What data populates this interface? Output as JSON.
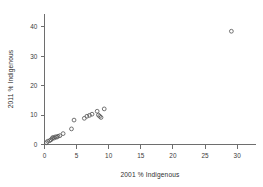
{
  "chart_data": {
    "type": "scatter",
    "title": "",
    "xlabel": "2001 % Indigenous",
    "ylabel": "2011 % Indigenous",
    "xlim": [
      0,
      32
    ],
    "ylim": [
      0,
      43
    ],
    "xticks": [
      0,
      5,
      10,
      15,
      20,
      25,
      30
    ],
    "yticks": [
      0,
      10,
      20,
      30,
      40
    ],
    "grid": false,
    "legend": null,
    "marker": "open-circle",
    "marker_color": "#5a5a5a",
    "points": [
      {
        "x": 0.3,
        "y": 0.6
      },
      {
        "x": 0.5,
        "y": 1.1
      },
      {
        "x": 0.8,
        "y": 1.3
      },
      {
        "x": 1.0,
        "y": 1.6
      },
      {
        "x": 1.2,
        "y": 2.0
      },
      {
        "x": 1.3,
        "y": 2.4
      },
      {
        "x": 1.5,
        "y": 2.2
      },
      {
        "x": 1.7,
        "y": 2.6
      },
      {
        "x": 1.9,
        "y": 2.5
      },
      {
        "x": 2.1,
        "y": 2.8
      },
      {
        "x": 2.4,
        "y": 3.0
      },
      {
        "x": 2.9,
        "y": 3.7
      },
      {
        "x": 4.2,
        "y": 5.3
      },
      {
        "x": 4.6,
        "y": 8.3
      },
      {
        "x": 6.2,
        "y": 8.9
      },
      {
        "x": 6.6,
        "y": 9.6
      },
      {
        "x": 7.0,
        "y": 9.9
      },
      {
        "x": 7.4,
        "y": 10.3
      },
      {
        "x": 8.2,
        "y": 11.3
      },
      {
        "x": 8.4,
        "y": 10.0
      },
      {
        "x": 8.6,
        "y": 9.6
      },
      {
        "x": 8.8,
        "y": 9.2
      },
      {
        "x": 9.3,
        "y": 12.1
      },
      {
        "x": 29.1,
        "y": 38.5
      }
    ]
  },
  "axes": {
    "x_title": "2001 % Indigenous",
    "y_title": "2011 % Indigenous",
    "x_tick_labels": [
      "0",
      "5",
      "10",
      "15",
      "20",
      "25",
      "30"
    ],
    "y_tick_labels": [
      "0",
      "10",
      "20",
      "30",
      "40"
    ]
  },
  "colors": {
    "background": "#ffffff",
    "axis": "#6e6e6e",
    "text": "#3a3a3a",
    "marker": "#5a5a5a"
  }
}
